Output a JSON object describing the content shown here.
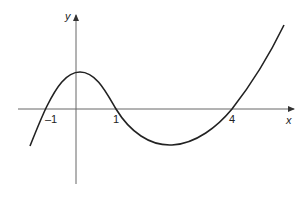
{
  "diagram": {
    "type": "function-graph",
    "axes": {
      "x_label": "x",
      "y_label": "y"
    },
    "x_intercepts": [
      {
        "value": -1,
        "label": "–1"
      },
      {
        "value": 1,
        "label": "1"
      },
      {
        "value": 4,
        "label": "4"
      }
    ],
    "curve_color": "#222222",
    "axis_color": "#555555"
  }
}
